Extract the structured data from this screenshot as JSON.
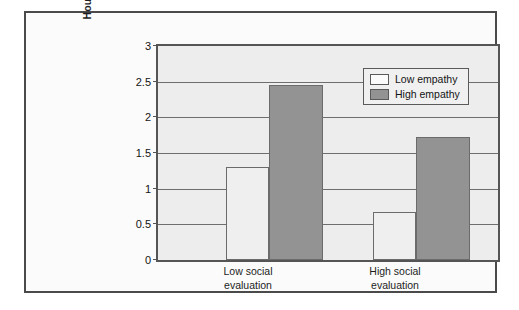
{
  "figure": {
    "background_color": "#fbfbfb",
    "frame_color": "#4a4a4a",
    "plot_background_color": "#ededed"
  },
  "chart_data": {
    "type": "bar",
    "title": "",
    "subtitle": "",
    "xlabel": "",
    "ylabel": "Hours participant would spend with Janet",
    "ylabel_lines": [
      "Hours participant would spend",
      "with Janet"
    ],
    "categories": [
      "Low social evaluation",
      "High social evaluation"
    ],
    "category_lines": [
      [
        "Low social",
        "evaluation"
      ],
      [
        "High social",
        "evaluation"
      ]
    ],
    "series": [
      {
        "name": "Low empathy",
        "color": "#efefef",
        "values": [
          1.3,
          0.67
        ]
      },
      {
        "name": "High empathy",
        "color": "#939393",
        "values": [
          2.45,
          1.72
        ]
      }
    ],
    "ylim": [
      0,
      3
    ],
    "ytick_values": [
      0,
      0.5,
      1,
      1.5,
      2,
      2.5,
      3
    ],
    "ytick_labels": [
      "0",
      "0.5",
      "1",
      "1.5",
      "2",
      "2.5",
      "3"
    ],
    "grid": true,
    "grid_axis": "y",
    "legend_position": "top-right-inside",
    "legend_entries": [
      "Low empathy",
      "High empathy"
    ]
  }
}
